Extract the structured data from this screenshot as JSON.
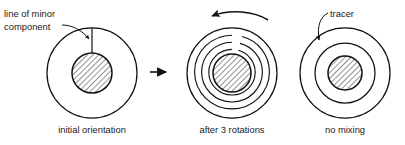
{
  "figure": {
    "background_color": "#ffffff",
    "line_color": "#111111",
    "text_color": "#1a1a1a",
    "hatch_color": "#6e6e6e"
  },
  "annotations": {
    "minor_component_line1": "line of minor",
    "minor_component_line2": "component",
    "tracer": "tracer"
  },
  "panels": [
    {
      "id": "initial",
      "caption": "initial orientation",
      "center": [
        92,
        73
      ],
      "outer_radius": 45,
      "core_radius": 20,
      "rings": [],
      "tracer_type": "radial-line"
    },
    {
      "id": "after-3-rotations",
      "caption": "after 3 rotations",
      "center": [
        232,
        73
      ],
      "outer_radius": 45,
      "core_radius": 19,
      "rings": [
        38,
        31,
        24
      ],
      "tracer_type": "spiral",
      "spiral_turns": 3,
      "rotation_arrow": "counterclockwise"
    },
    {
      "id": "no-mixing",
      "caption": "no mixing",
      "center": [
        345,
        73
      ],
      "outer_radius": 45,
      "core_radius": 17,
      "rings": [
        30
      ],
      "tracer_type": "concentric-ring"
    }
  ],
  "connector": {
    "label": "process-arrow",
    "from": [
      150,
      72
    ],
    "to": [
      170,
      72
    ]
  }
}
